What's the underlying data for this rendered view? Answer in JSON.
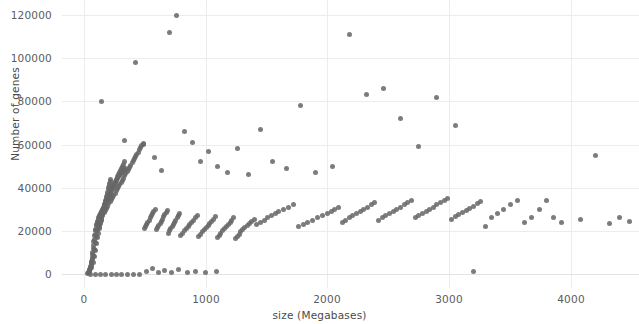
{
  "figure": {
    "background_color": "#ffffff",
    "plot_background_color": "#ffffff",
    "grid_color": "#ececec",
    "point_color": "#676767",
    "axis_text_color": "#5b5b5b"
  },
  "chart_data": {
    "type": "scatter",
    "title": "",
    "xlabel": "size (Megabases)",
    "ylabel": "Number of genes",
    "xlim": [
      -180,
      4560
    ],
    "ylim": [
      -6500,
      127000
    ],
    "xticks": [
      0,
      1000,
      2000,
      3000,
      4000
    ],
    "xticklabels": [
      "0",
      "1000",
      "2000",
      "3000",
      "4000"
    ],
    "yticks": [
      0,
      20000,
      40000,
      60000,
      80000,
      100000,
      120000
    ],
    "yticklabels": [
      "0",
      "20000",
      "40000",
      "60000",
      "80000",
      "100000",
      "120000"
    ],
    "grid": true,
    "grid_axis": "both",
    "legend": false,
    "marker": "circle",
    "marker_size": 5,
    "marker_opacity": 0.86,
    "series": [
      {
        "name": "genomes",
        "x": [
          60,
          75,
          88,
          95,
          102,
          110,
          118,
          125,
          130,
          135,
          140,
          145,
          150,
          155,
          158,
          162,
          166,
          170,
          174,
          178,
          182,
          186,
          190,
          194,
          198,
          202,
          206,
          210,
          214,
          218,
          45,
          52,
          58,
          64,
          70,
          76,
          82,
          90,
          96,
          104,
          112,
          120,
          128,
          136,
          144,
          152,
          160,
          168,
          176,
          184,
          192,
          200,
          208,
          216,
          224,
          232,
          240,
          248,
          256,
          264,
          272,
          280,
          288,
          296,
          304,
          312,
          320,
          328,
          336,
          344,
          36,
          42,
          48,
          54,
          62,
          68,
          74,
          80,
          86,
          92,
          98,
          106,
          114,
          122,
          130,
          138,
          146,
          154,
          164,
          172,
          180,
          188,
          196,
          204,
          212,
          220,
          228,
          236,
          244,
          252,
          260,
          268,
          276,
          284,
          292,
          300,
          308,
          316,
          324,
          332,
          30,
          38,
          46,
          56,
          66,
          72,
          78,
          84,
          94,
          100,
          108,
          116,
          124,
          132,
          142,
          148,
          156,
          165,
          175,
          185,
          195,
          205,
          215,
          225,
          235,
          245,
          255,
          265,
          275,
          285,
          295,
          305,
          315,
          325,
          335,
          345,
          355,
          365,
          375,
          385,
          395,
          405,
          415,
          425,
          435,
          445,
          455,
          465,
          475,
          485,
          495,
          505,
          515,
          525,
          535,
          545,
          555,
          565,
          575,
          585,
          595,
          605,
          615,
          625,
          635,
          645,
          655,
          665,
          675,
          685,
          695,
          705,
          715,
          725,
          735,
          745,
          755,
          765,
          775,
          785,
          795,
          810,
          825,
          840,
          855,
          870,
          885,
          900,
          915,
          930,
          945,
          960,
          975,
          990,
          1005,
          1020,
          1035,
          1050,
          1065,
          1080,
          1095,
          1110,
          1125,
          1140,
          1155,
          1170,
          1185,
          1200,
          1215,
          1230,
          1245,
          1260,
          1275,
          1290,
          1305,
          1320,
          1340,
          1360,
          1380,
          1400,
          1420,
          1450,
          1480,
          1510,
          1540,
          1570,
          1600,
          1640,
          1680,
          1720,
          1760,
          1800,
          1840,
          1880,
          1920,
          1960,
          2000,
          2030,
          2060,
          2090,
          2120,
          2150,
          2180,
          2210,
          2240,
          2270,
          2300,
          2330,
          2360,
          2390,
          2420,
          2450,
          2480,
          2510,
          2540,
          2570,
          2600,
          2630,
          2660,
          2690,
          2720,
          2750,
          2780,
          2810,
          2840,
          2870,
          2900,
          2930,
          2960,
          2990,
          3020,
          3050,
          3080,
          3110,
          3140,
          3170,
          3200,
          3230,
          3260,
          3300,
          3350,
          3400,
          3450,
          3500,
          3560,
          3620,
          3680,
          3740,
          3800,
          3860,
          3920,
          4080,
          4200,
          4320,
          4400,
          4480,
          140,
          330,
          420,
          490,
          580,
          640,
          700,
          760,
          830,
          890,
          960,
          1020,
          1100,
          1180,
          1260,
          1350,
          1450,
          1550,
          1660,
          1780,
          1900,
          2040,
          2180,
          2320,
          2460,
          2600,
          2750,
          2900,
          3050,
          3200,
          55,
          95,
          135,
          180,
          225,
          270,
          310,
          360,
          410,
          460,
          510,
          560,
          610,
          660,
          720,
          780,
          850,
          920,
          1000,
          1090
        ],
        "y": [
          3000,
          5200,
          8000,
          11000,
          14000,
          17000,
          19000,
          21000,
          22000,
          23500,
          25000,
          26000,
          27000,
          28000,
          29000,
          30000,
          31000,
          32000,
          33000,
          34000,
          35000,
          36000,
          37000,
          38000,
          39000,
          40000,
          41000,
          42000,
          43000,
          44000,
          1500,
          2500,
          4000,
          6000,
          9000,
          12000,
          15000,
          18000,
          20000,
          22500,
          24000,
          25500,
          26500,
          27500,
          28500,
          29500,
          30500,
          31500,
          32500,
          33500,
          34500,
          35500,
          36500,
          37500,
          38500,
          39500,
          40500,
          41500,
          42500,
          43500,
          44500,
          45000,
          45500,
          46000,
          46500,
          47000,
          47500,
          48000,
          48500,
          49000,
          500,
          1000,
          2000,
          3500,
          5500,
          7500,
          10000,
          13000,
          16000,
          18500,
          20500,
          23000,
          24500,
          26000,
          27000,
          28000,
          29000,
          30000,
          31000,
          32000,
          33000,
          34000,
          35000,
          36000,
          37000,
          38000,
          39000,
          40000,
          41000,
          42000,
          43000,
          44000,
          45000,
          46000,
          47000,
          48000,
          49000,
          50000,
          51000,
          52000,
          200,
          800,
          1800,
          3000,
          4800,
          6800,
          8800,
          11500,
          14500,
          17500,
          20000,
          21500,
          23000,
          24500,
          25500,
          26500,
          27500,
          28500,
          29500,
          30500,
          31500,
          32500,
          33500,
          34500,
          35500,
          36500,
          37500,
          38500,
          39500,
          40500,
          41500,
          42500,
          43500,
          44500,
          45500,
          46500,
          47500,
          48500,
          49500,
          50500,
          51500,
          52500,
          53500,
          54500,
          55500,
          56500,
          57500,
          58500,
          59500,
          60500,
          21000,
          22000,
          23000,
          24000,
          25000,
          26000,
          27000,
          28000,
          29000,
          30000,
          20500,
          21500,
          22500,
          23500,
          24500,
          25500,
          26500,
          27500,
          28500,
          29500,
          19000,
          20000,
          21000,
          22000,
          23000,
          24000,
          25000,
          26000,
          27000,
          28000,
          18000,
          19000,
          20000,
          21000,
          22000,
          23000,
          24000,
          25000,
          26000,
          27000,
          17500,
          18500,
          19500,
          20500,
          21500,
          22500,
          23500,
          24500,
          25500,
          26500,
          17000,
          18000,
          19000,
          20000,
          21000,
          22000,
          23000,
          24000,
          25000,
          26000,
          16500,
          17500,
          18500,
          19500,
          20500,
          21500,
          22500,
          23500,
          24500,
          25500,
          23000,
          24000,
          25000,
          26000,
          27000,
          28000,
          29000,
          30000,
          31000,
          32000,
          22000,
          23000,
          24000,
          25000,
          26000,
          27000,
          28000,
          29000,
          30000,
          31000,
          24000,
          25000,
          26000,
          27000,
          28000,
          29000,
          30000,
          31000,
          32000,
          33000,
          25000,
          26000,
          27000,
          28000,
          29000,
          30000,
          31000,
          32000,
          33000,
          34000,
          26000,
          27000,
          28000,
          29000,
          30000,
          31000,
          32000,
          33000,
          34000,
          35000,
          25500,
          26500,
          27500,
          28500,
          29500,
          30500,
          31500,
          32500,
          33500,
          22000,
          26000,
          28000,
          30000,
          32000,
          34000,
          24000,
          26000,
          30000,
          34000,
          26000,
          24000,
          25500,
          55000,
          23500,
          26000,
          24500,
          80000,
          62000,
          98000,
          60000,
          54000,
          48000,
          112000,
          120000,
          66000,
          61000,
          52000,
          57000,
          50000,
          47000,
          58000,
          46000,
          67000,
          52000,
          49000,
          78000,
          47000,
          50000,
          111000,
          83000,
          86000,
          72000,
          59000,
          82000,
          69000,
          1000,
          0,
          0,
          0,
          0,
          0,
          0,
          0,
          0,
          0,
          0,
          1200,
          2400,
          800,
          1600,
          900,
          2000,
          700,
          1400,
          600,
          1100
        ]
      }
    ]
  },
  "axes": {
    "y_title": "Number of genes",
    "x_title": "size (Megabases)"
  }
}
